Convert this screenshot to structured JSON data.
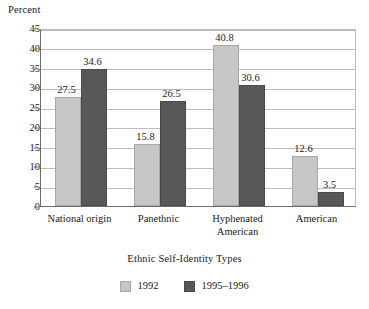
{
  "chart_data": {
    "type": "bar",
    "title": "",
    "ylabel": "Percent",
    "xlabel": "Ethnic Self-Identity Types",
    "ylim": [
      0,
      45
    ],
    "ytick_step": 5,
    "yticks": [
      "0",
      "5",
      "10",
      "15",
      "20",
      "25",
      "30",
      "35",
      "40",
      "45"
    ],
    "grid": true,
    "legend_position": "bottom",
    "categories": [
      "National origin",
      "Panethnic",
      "Hyphenated\nAmerican",
      "American"
    ],
    "series": [
      {
        "name": "1992",
        "color": "#c6c6c6",
        "values": [
          27.5,
          15.8,
          40.8,
          12.6
        ],
        "labels": [
          "27.5",
          "15.8",
          "40.8",
          "12.6"
        ]
      },
      {
        "name": "1995–1996",
        "color": "#585858",
        "values": [
          34.6,
          26.5,
          30.6,
          3.5
        ],
        "labels": [
          "34.6",
          "26.5",
          "30.6",
          "3.5"
        ]
      }
    ]
  },
  "legend": {
    "items": [
      {
        "label": "1992",
        "swatch": "legend-swatch-1992"
      },
      {
        "label": "1995–1996",
        "swatch": "legend-swatch-1995-1996"
      }
    ]
  },
  "colors": {
    "series_1": "#c6c6c6",
    "series_2": "#585858",
    "gridline": "#bdbdbd",
    "axis": "#6b6b6b",
    "text": "#1a1a1a",
    "background": "#ffffff"
  }
}
